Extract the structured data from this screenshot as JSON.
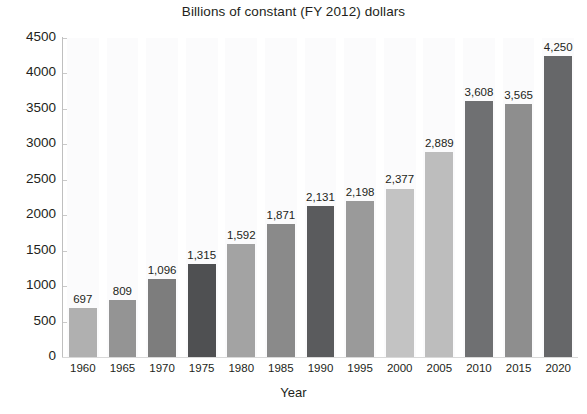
{
  "chart_data": {
    "type": "bar",
    "title": "Billions of constant (FY 2012) dollars",
    "xlabel": "Year",
    "ylabel": "",
    "categories": [
      "1960",
      "1965",
      "1970",
      "1975",
      "1980",
      "1985",
      "1990",
      "1995",
      "2000",
      "2005",
      "2010",
      "2015",
      "2020"
    ],
    "values": [
      697,
      809,
      1096,
      1315,
      1592,
      1871,
      2131,
      2198,
      2377,
      2889,
      3608,
      3565,
      4250
    ],
    "value_labels": [
      "697",
      "809",
      "1,096",
      "1,315",
      "1,592",
      "1,871",
      "2,131",
      "2,198",
      "2,377",
      "2,889",
      "3,608",
      "3,565",
      "4,250"
    ],
    "bar_colors": [
      "#b0b0b0",
      "#949494",
      "#7d7d7d",
      "#4f5052",
      "#a3a3a3",
      "#8a8a8a",
      "#5a5b5d",
      "#9a9a9a",
      "#c3c3c3",
      "#bdbdbd",
      "#6f7072",
      "#8e8e8e",
      "#666769"
    ],
    "ylim": [
      0,
      4500
    ],
    "ytick_step": 500,
    "ytick_labels": [
      "0",
      "500",
      "1000",
      "1500",
      "2000",
      "2500",
      "3000",
      "3500",
      "4000",
      "4500"
    ],
    "grid": false,
    "legend": "none",
    "value_labels_shown": true
  }
}
